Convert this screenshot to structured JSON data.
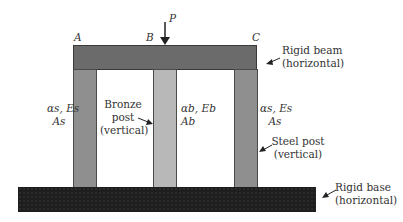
{
  "diagram": {
    "type": "structural",
    "load": {
      "label": "P"
    },
    "points": {
      "a": "A",
      "b": "B",
      "c": "C"
    },
    "beam": {
      "label_line1": "Rigid beam",
      "label_line2": "(horizontal)",
      "color": "#6b6b6b"
    },
    "base": {
      "label_line1": "Rigid base",
      "label_line2": "(horizontal)",
      "color": "#1e1e1e"
    },
    "left_post": {
      "props_line1": "αs, Es",
      "props_line2": "As",
      "color": "#8f8f8f"
    },
    "middle_post": {
      "label_line1": "Bronze",
      "label_line2": "post",
      "label_line3": "(vertical)",
      "props_line1": "αb, Eb",
      "props_line2": "Ab",
      "color": "#b8b8b8"
    },
    "right_post": {
      "label_line1": "Steel post",
      "label_line2": "(vertical)",
      "props_line1": "αs, Es",
      "props_line2": "As",
      "color": "#8f8f8f"
    }
  }
}
